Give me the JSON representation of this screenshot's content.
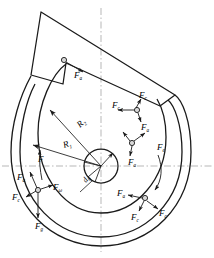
{
  "figure": {
    "type": "engineering-force-diagram",
    "background": "#ffffff",
    "line_color": "#1a1a1a",
    "centerline_color": "#999999"
  },
  "geometry": {
    "center": {
      "x": 101,
      "y": 166
    },
    "hub_radius": 17,
    "inner_spiral_label": "R_1",
    "outer_spiral_label": "R_2"
  },
  "labels": {
    "radius_outer": {
      "base": "R",
      "sub": "2"
    },
    "radius_inner": {
      "base": "R",
      "sub": "1"
    },
    "element_angle": {
      "base": "d",
      "sub": "θ"
    },
    "force_plain": {
      "base": "F",
      "sub": ""
    },
    "force_a": {
      "base": "F",
      "sub": "a"
    },
    "force_c": {
      "base": "F",
      "sub": "c"
    },
    "force_e": {
      "base": "F",
      "sub": "e"
    },
    "force_omega": {
      "base": "F",
      "sub": "ω"
    },
    "force_g": {
      "base": "F",
      "sub": "g"
    }
  },
  "annotations": [
    {
      "id": "blade-force-a",
      "base": "F",
      "sub": "a",
      "x": 74,
      "y": 71
    },
    {
      "id": "top-right-force-c",
      "base": "F",
      "sub": "c",
      "x": 143,
      "y": 95
    },
    {
      "id": "top-right-force-c2",
      "base": "F",
      "sub": "c",
      "x": 116,
      "y": 106
    },
    {
      "id": "top-right-force-a",
      "base": "F",
      "sub": "a",
      "x": 143,
      "y": 121
    },
    {
      "id": "mid-right-force-a",
      "base": "F",
      "sub": "a",
      "x": 131,
      "y": 155
    },
    {
      "id": "right-force-e",
      "base": "F",
      "sub": "e",
      "x": 160,
      "y": 146
    },
    {
      "id": "radius-outer-label",
      "base": "R",
      "sub": "2",
      "x": 80,
      "y": 128
    },
    {
      "id": "radius-inner-label",
      "base": "R",
      "sub": "1",
      "x": 64,
      "y": 148
    },
    {
      "id": "element-angle-label",
      "base": "d",
      "sub": "θ",
      "x": 86,
      "y": 183
    },
    {
      "id": "left-force-plain",
      "base": "F",
      "sub": "",
      "x": 41,
      "y": 157
    },
    {
      "id": "left-force-a",
      "base": "F",
      "sub": "a",
      "x": 21,
      "y": 176
    },
    {
      "id": "left-force-omega",
      "base": "F",
      "sub": "ω",
      "x": 56,
      "y": 186
    },
    {
      "id": "left-force-c",
      "base": "F",
      "sub": "c",
      "x": 16,
      "y": 196
    },
    {
      "id": "bottom-force-g",
      "base": "F",
      "sub": "g",
      "x": 39,
      "y": 224
    },
    {
      "id": "bottom-right-force-a",
      "base": "F",
      "sub": "a",
      "x": 122,
      "y": 196
    },
    {
      "id": "bottom-right-force-c",
      "base": "F",
      "sub": "c",
      "x": 135,
      "y": 214
    },
    {
      "id": "bottom-right-force-c2",
      "base": "F",
      "sub": "c",
      "x": 162,
      "y": 211
    }
  ]
}
